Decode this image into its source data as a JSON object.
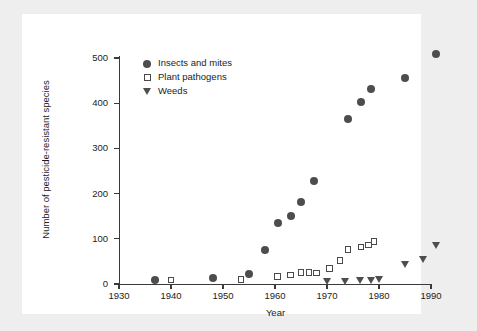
{
  "chart_data": {
    "type": "scatter",
    "title": "",
    "xlabel": "Year",
    "ylabel": "Number of pesticide-resistant species",
    "xlim": [
      1930,
      1992
    ],
    "ylim": [
      0,
      520
    ],
    "xticks": [
      1930,
      1940,
      1950,
      1960,
      1970,
      1980,
      1990
    ],
    "yticks": [
      0,
      100,
      200,
      300,
      400,
      500
    ],
    "grid": false,
    "legend_position": "top-left",
    "series": [
      {
        "name": "Insects and mites",
        "marker": "filled-circle",
        "color": "#4d4d4d",
        "points": [
          {
            "x": 1937,
            "y": 8
          },
          {
            "x": 1948,
            "y": 14
          },
          {
            "x": 1955,
            "y": 22
          },
          {
            "x": 1958,
            "y": 75
          },
          {
            "x": 1960.5,
            "y": 136
          },
          {
            "x": 1963,
            "y": 150
          },
          {
            "x": 1965,
            "y": 182
          },
          {
            "x": 1967.5,
            "y": 227
          },
          {
            "x": 1974,
            "y": 364
          },
          {
            "x": 1976.5,
            "y": 403
          },
          {
            "x": 1978.5,
            "y": 431
          },
          {
            "x": 1985,
            "y": 456
          },
          {
            "x": 1991,
            "y": 509
          }
        ]
      },
      {
        "name": "Plant pathogens",
        "marker": "open-square",
        "color": "#4a4a4a",
        "points": [
          {
            "x": 1940,
            "y": 9
          },
          {
            "x": 1953.5,
            "y": 10
          },
          {
            "x": 1960.5,
            "y": 17
          },
          {
            "x": 1963,
            "y": 20
          },
          {
            "x": 1965,
            "y": 25
          },
          {
            "x": 1966.5,
            "y": 26
          },
          {
            "x": 1968,
            "y": 24
          },
          {
            "x": 1970.5,
            "y": 34
          },
          {
            "x": 1972.5,
            "y": 52
          },
          {
            "x": 1974,
            "y": 76
          },
          {
            "x": 1976.5,
            "y": 82
          },
          {
            "x": 1978,
            "y": 86
          },
          {
            "x": 1979,
            "y": 94
          }
        ]
      },
      {
        "name": "Weeds",
        "marker": "filled-triangle-down",
        "color": "#4d4d4d",
        "points": [
          {
            "x": 1970,
            "y": 5
          },
          {
            "x": 1973.5,
            "y": 6
          },
          {
            "x": 1976.5,
            "y": 7
          },
          {
            "x": 1978.5,
            "y": 8
          },
          {
            "x": 1980,
            "y": 10
          },
          {
            "x": 1985,
            "y": 44
          },
          {
            "x": 1988.5,
            "y": 55
          },
          {
            "x": 1991,
            "y": 85
          }
        ]
      }
    ]
  }
}
